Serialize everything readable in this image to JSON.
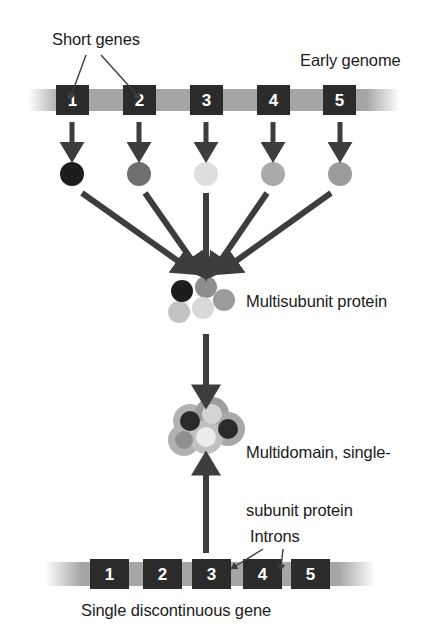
{
  "figure": {
    "background_color": "#ffffff",
    "ink_color": "#1b1b1b"
  },
  "labels": {
    "short_genes": "Short genes",
    "early_genome": "Early genome",
    "multisubunit_protein": "Multisubunit protein",
    "multidomain_protein_line1": "Multidomain, single-",
    "multidomain_protein_line2": "subunit protein",
    "introns": "Introns",
    "single_discontinuous_gene": "Single discontinuous gene"
  },
  "early_genome": {
    "strand_color": "#a6a6a6",
    "exon_color": "#2b2b2b",
    "exon_text_color": "#ffffff",
    "exons": [
      {
        "label": "1",
        "x": 56
      },
      {
        "label": "2",
        "x": 123
      },
      {
        "label": "3",
        "x": 190
      },
      {
        "label": "4",
        "x": 257
      },
      {
        "label": "5",
        "x": 323
      }
    ]
  },
  "subunits": [
    {
      "name": "subunit-1",
      "color": "#1d1d1d",
      "cx": 72,
      "cy": 174,
      "r": 12
    },
    {
      "name": "subunit-2",
      "color": "#6f6f6f",
      "cx": 139,
      "cy": 174,
      "r": 12
    },
    {
      "name": "subunit-3",
      "color": "#dedede",
      "cx": 206,
      "cy": 174,
      "r": 12
    },
    {
      "name": "subunit-4",
      "color": "#aaaaaa",
      "cx": 273,
      "cy": 174,
      "r": 12
    },
    {
      "name": "subunit-5",
      "color": "#9b9b9b",
      "cx": 340,
      "cy": 174,
      "r": 12
    }
  ],
  "multisubunit_protein": {
    "circles": [
      {
        "name": "cluster-circle-dark",
        "color": "#1d1d1d",
        "cx": 182,
        "cy": 291,
        "r": 11
      },
      {
        "name": "cluster-circle-mid",
        "color": "#8d8d8d",
        "cx": 206,
        "cy": 287,
        "r": 11
      },
      {
        "name": "cluster-circle-light",
        "color": "#d9d9d9",
        "cx": 203,
        "cy": 308,
        "r": 11
      },
      {
        "name": "cluster-circle-grey",
        "color": "#9b9b9b",
        "cx": 224,
        "cy": 300,
        "r": 11
      },
      {
        "name": "cluster-circle-pale",
        "color": "#c2c2c2",
        "cx": 179,
        "cy": 312,
        "r": 11
      }
    ]
  },
  "multidomain_protein": {
    "domains": [
      {
        "name": "domain-1",
        "halo_color": "#b3b3b3",
        "core_color": "#2a2a2a",
        "cx": 190,
        "cy": 421,
        "r_outer": 17,
        "r_core": 10
      },
      {
        "name": "domain-2",
        "halo_color": "#9d9d9d",
        "core_color": "#d4d4d4",
        "cx": 212,
        "cy": 414,
        "r_outer": 17,
        "r_core": 10
      },
      {
        "name": "domain-3",
        "halo_color": "#a8a8a8",
        "core_color": "#2a2a2a",
        "cx": 228,
        "cy": 429,
        "r_outer": 17,
        "r_core": 10
      },
      {
        "name": "domain-4",
        "halo_color": "#c0c0c0",
        "core_color": "#ececec",
        "cx": 206,
        "cy": 437,
        "r_outer": 17,
        "r_core": 10
      },
      {
        "name": "domain-5",
        "halo_color": "#b0b0b0",
        "core_color": "#8f8f8f",
        "cx": 184,
        "cy": 440,
        "r_outer": 16,
        "r_core": 9
      }
    ]
  },
  "late_genome": {
    "strand_color": "#a6a6a6",
    "exon_color": "#2b2b2b",
    "exon_text_color": "#ffffff",
    "exons": [
      {
        "label": "1",
        "x": 90
      },
      {
        "label": "2",
        "x": 143
      },
      {
        "label": "3",
        "x": 192
      },
      {
        "label": "4",
        "x": 243
      },
      {
        "label": "5",
        "x": 291
      }
    ],
    "intron_leader_targets": [
      {
        "x": 233,
        "y": 566
      },
      {
        "x": 281,
        "y": 566
      }
    ]
  },
  "arrows": {
    "color": "#3d3d3d",
    "transcription_down": [
      {
        "name": "arrow-gene-1-to-subunit-1",
        "x": 72
      },
      {
        "name": "arrow-gene-2-to-subunit-2",
        "x": 139
      },
      {
        "name": "arrow-gene-3-to-subunit-3",
        "x": 206
      },
      {
        "name": "arrow-gene-4-to-subunit-4",
        "x": 273
      },
      {
        "name": "arrow-gene-5-to-subunit-5",
        "x": 340
      }
    ],
    "assembly_converging": [
      {
        "name": "arrow-assembly-1",
        "x1": 82,
        "y1": 193,
        "x2": 185,
        "y2": 268
      },
      {
        "name": "arrow-assembly-2",
        "x1": 145,
        "y1": 193,
        "x2": 198,
        "y2": 268
      },
      {
        "name": "arrow-assembly-3",
        "x1": 206,
        "y1": 193,
        "x2": 206,
        "y2": 268
      },
      {
        "name": "arrow-assembly-4",
        "x1": 267,
        "y1": 193,
        "x2": 216,
        "y2": 268
      },
      {
        "name": "arrow-assembly-5",
        "x1": 331,
        "y1": 193,
        "x2": 230,
        "y2": 268
      }
    ],
    "fusion_down": {
      "name": "arrow-multisubunit-to-multidomain",
      "x": 206,
      "y1": 334,
      "y2": 396
    },
    "gene_up": {
      "name": "arrow-gene-to-protein",
      "x": 206,
      "y1": 553,
      "y2": 466
    }
  },
  "leader_lines": {
    "color": "#3d3d3d",
    "short_genes": [
      {
        "name": "leader-short-genes-to-exon-1",
        "x1": 86,
        "y1": 55,
        "x2": 71,
        "y2": 97
      },
      {
        "name": "leader-short-genes-to-exon-2",
        "x1": 101,
        "y1": 55,
        "x2": 138,
        "y2": 97
      }
    ],
    "introns": [
      {
        "name": "leader-introns-to-intron-a",
        "x1": 263,
        "y1": 549,
        "x2": 233,
        "y2": 568
      },
      {
        "name": "leader-introns-to-intron-b",
        "x1": 284,
        "y1": 549,
        "x2": 281,
        "y2": 568
      }
    ]
  }
}
